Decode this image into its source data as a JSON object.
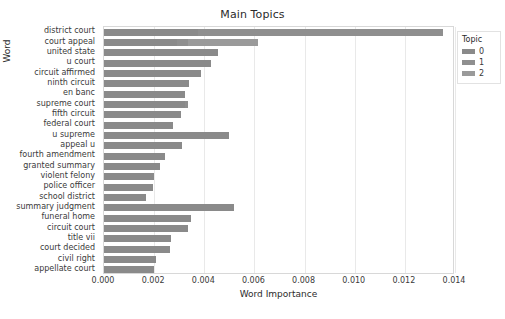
{
  "chart_data": {
    "type": "bar",
    "orientation": "horizontal",
    "stacked": true,
    "title": "Main Topics",
    "xlabel": "Word Importance",
    "ylabel": "Word",
    "xlim": [
      0.0,
      0.014
    ],
    "xticks": [
      "0.000",
      "0.002",
      "0.004",
      "0.006",
      "0.008",
      "0.010",
      "0.012",
      "0.014"
    ],
    "xtick_values": [
      0.0,
      0.002,
      0.004,
      0.006,
      0.008,
      0.01,
      0.012,
      0.014
    ],
    "grid": true,
    "grid_axis": "x",
    "legend": {
      "title": "Topic",
      "position": "right",
      "entries": [
        {
          "label": "0",
          "color": "#8a8a8a"
        },
        {
          "label": "1",
          "color": "#8f8f8f"
        },
        {
          "label": "2",
          "color": "#9a9a9a"
        }
      ]
    },
    "categories": [
      "district court",
      "court appeal",
      "united state",
      "u court",
      "circuit affirmed",
      "ninth circuit",
      "en banc",
      "supreme court",
      "fifth circuit",
      "federal court",
      "u supreme",
      "appeal u",
      "fourth amendment",
      "granted summary",
      "violent felony",
      "police officer",
      "school district",
      "summary judgment",
      "funeral home",
      "circuit court",
      "title vii",
      "court decided",
      "civil right",
      "appellate court"
    ],
    "series": [
      {
        "name": "0",
        "color": "#8a8a8a",
        "values": [
          0.00373,
          0.00292,
          0.00453,
          0.00428,
          0.00386,
          0.00341,
          0.00324,
          0.00325,
          0.00307,
          0.00274,
          0.00499,
          0.00311,
          0.00243,
          0.00224,
          0.00198,
          0.00194,
          0.00167,
          0.00519,
          0.00347,
          0.00337,
          0.00268,
          0.00262,
          0.00209,
          0.00201
        ]
      },
      {
        "name": "1",
        "color": "#8f8f8f",
        "values": [
          0.00978,
          0.00045,
          0.0,
          0.0,
          0.0,
          0.0,
          0.0,
          0.00012,
          0.0,
          0.0,
          0.0,
          0.0,
          0.0,
          0.0,
          0.0,
          0.0,
          0.0,
          0.0,
          0.0,
          0.0,
          0.0,
          0.0,
          0.0,
          0.0
        ]
      },
      {
        "name": "2",
        "color": "#9a9a9a",
        "values": [
          0.0,
          0.00279,
          0.0,
          0.0,
          0.0,
          0.0,
          0.0,
          0.0,
          0.0,
          0.0,
          0.0,
          0.0,
          0.0,
          0.0,
          0.0,
          0.0,
          0.0,
          0.0,
          0.0,
          0.0,
          0.0,
          0.0,
          0.0,
          0.0
        ]
      }
    ],
    "totals": [
      0.01351,
      0.00616,
      0.00453,
      0.00428,
      0.00386,
      0.00341,
      0.00324,
      0.00337,
      0.00307,
      0.00274,
      0.00499,
      0.00311,
      0.00243,
      0.00224,
      0.00198,
      0.00194,
      0.00167,
      0.00519,
      0.00347,
      0.00337,
      0.00268,
      0.00262,
      0.00209,
      0.00201
    ]
  }
}
